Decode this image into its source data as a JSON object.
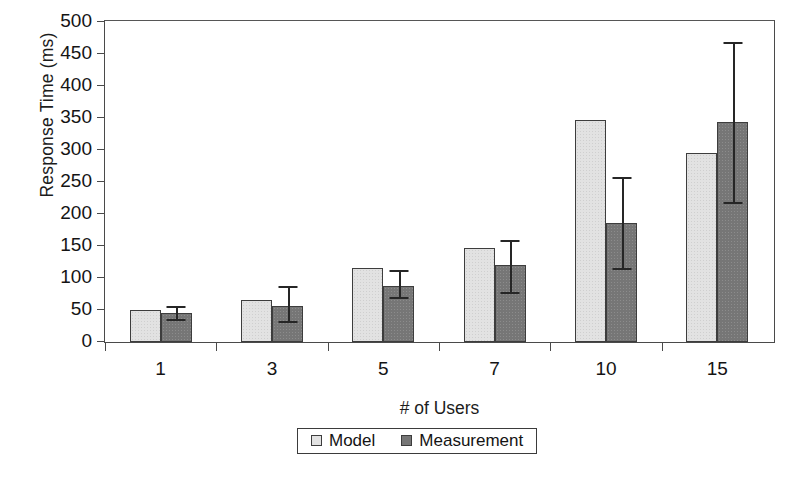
{
  "chart_data": {
    "type": "bar",
    "title": "",
    "xlabel": "# of Users",
    "ylabel": "Response Time (ms)",
    "categories": [
      "1",
      "3",
      "5",
      "7",
      "10",
      "15"
    ],
    "ylim": [
      0,
      500
    ],
    "ytick_step": 50,
    "yticks": [
      0,
      50,
      100,
      150,
      200,
      250,
      300,
      350,
      400,
      450,
      500
    ],
    "ytick_labels": [
      "0",
      "50",
      "100",
      "150",
      "200",
      "250",
      "300",
      "350",
      "400",
      "450",
      "500"
    ],
    "grid": false,
    "legend_position": "bottom-center",
    "series": [
      {
        "name": "Model",
        "color": "#e2e2e2",
        "values": [
          50,
          66,
          115,
          147,
          347,
          295
        ],
        "errors": [
          null,
          null,
          null,
          null,
          null,
          null
        ]
      },
      {
        "name": "Measurement",
        "color": "#767676",
        "values": [
          45,
          57,
          88,
          120,
          186,
          343
        ],
        "error_low": [
          36,
          33,
          71,
          78,
          116,
          218
        ],
        "error_high": [
          56,
          88,
          112,
          160,
          258,
          468
        ]
      }
    ]
  },
  "legend": {
    "entries": [
      {
        "label": "Model",
        "swatch": "light-gray-square-icon"
      },
      {
        "label": "Measurement",
        "swatch": "dark-gray-square-icon"
      }
    ]
  }
}
